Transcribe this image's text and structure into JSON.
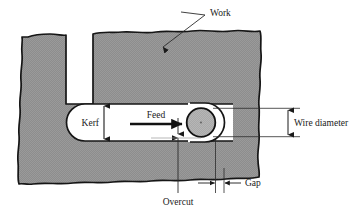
{
  "figure": {
    "background_color": "#ffffff",
    "material_fill_color": "#8d8d8d",
    "material_outline_color": "#1a1a1a",
    "wire_fill_color": "#a8a8a8",
    "leader_line_color": "#2b2b2b"
  },
  "labels": {
    "work": "Work",
    "kerf": "Kerf",
    "feed": "Feed",
    "wire_diameter": "Wire diameter",
    "gap": "Gap",
    "overcut": "Overcut"
  },
  "annotations": {
    "work_callout": {
      "text": "Work",
      "leader": "diagonal line from label down-left to arrowhead on top surface of workpiece",
      "arrow": "single-headed, pointing down into material"
    },
    "kerf_dimension": {
      "text": "Kerf",
      "type": "vertical double-headed dimension arrow",
      "measures": "height of the slot cut by the wire"
    },
    "feed_arrow": {
      "text": "Feed",
      "type": "bold single-headed horizontal arrow pointing right",
      "meaning": "direction of wire travel through work"
    },
    "wire_diameter_dimension": {
      "text": "Wire diameter",
      "type": "vertical double-headed dimension arrow between two horizontal extension lines",
      "measures": "diameter of the wire electrode"
    },
    "gap_dimension": {
      "text": "Gap",
      "type": "horizontal dimension with two arrows pointing inward between extension lines",
      "measures": "spark gap between wire surface and work surface"
    },
    "overcut_callout": {
      "text": "Overcut",
      "leader": "vertical line from label up to arrowhead at the kerf surface",
      "arrow": "single-headed, pointing up"
    }
  },
  "geometry": {
    "wire_center": {
      "x": 201,
      "y": 122
    },
    "wire_radius": 14.5,
    "kerf_top_y": 104,
    "kerf_bottom_y": 141,
    "note": "C-shaped workpiece cross-section with torn/broken-out wavy edges; horizontal slot (kerf) cut inward from the right with a rounded left end and the round wire electrode at the cutting front"
  }
}
